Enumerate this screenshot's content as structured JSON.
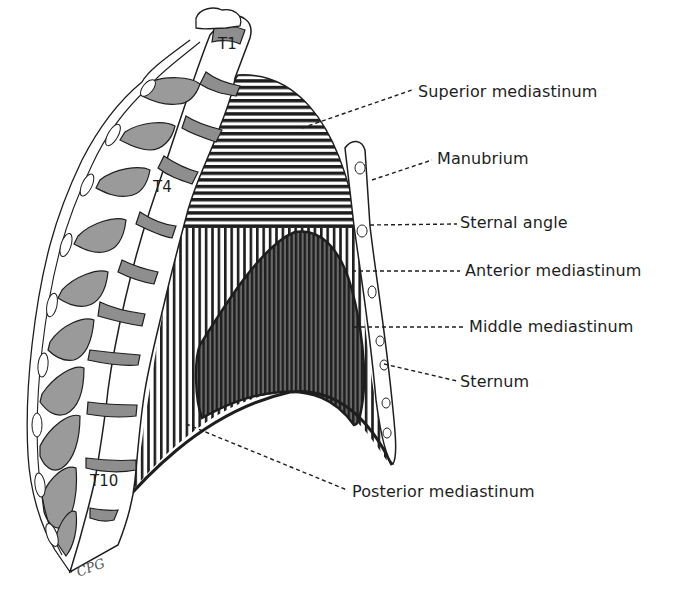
{
  "figure": {
    "labels": {
      "superior_mediastinum": "Superior mediastinum",
      "manubrium": "Manubrium",
      "sternal_angle": "Sternal angle",
      "anterior_mediastinum": "Anterior mediastinum",
      "middle_mediastinum": "Middle mediastinum",
      "sternum": "Sternum",
      "posterior_mediastinum": "Posterior mediastinum"
    },
    "vertebra_labels": {
      "t1": "T1",
      "t4": "T4",
      "t10": "T10"
    },
    "signature": "CPG",
    "colors": {
      "line": "#1e1e1e",
      "rib_fill": "#9a9a9a",
      "disc_fill": "#8e8e8e",
      "middle_fill": "#505050",
      "background": "#ffffff"
    }
  }
}
